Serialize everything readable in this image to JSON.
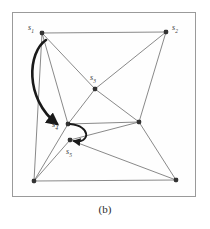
{
  "figure": {
    "caption": "(b)",
    "frame": {
      "border_color": "#9a9a9a",
      "background": "#fefefe"
    }
  },
  "diagram": {
    "type": "graph",
    "edge_color": "#6b6b6b",
    "node_color": "#333333",
    "arrow_color": "#1a1a1a",
    "nodes": [
      {
        "id": "s1",
        "label": "s",
        "sub": "1",
        "x": 42,
        "y": 33,
        "label_x": 28,
        "label_y": 24
      },
      {
        "id": "s2",
        "label": "s",
        "sub": "2",
        "x": 166,
        "y": 32,
        "label_x": 172,
        "label_y": 24
      },
      {
        "id": "s3",
        "label": "s",
        "sub": "3",
        "x": 95,
        "y": 89,
        "label_x": 90,
        "label_y": 74
      },
      {
        "id": "s4",
        "label": "s",
        "sub": "4",
        "x": 68,
        "y": 124,
        "label_x": 52,
        "label_y": 121
      },
      {
        "id": "s5",
        "label": "s",
        "sub": "5",
        "x": 70,
        "y": 140,
        "label_x": 66,
        "label_y": 148
      },
      {
        "id": "r1",
        "label": "",
        "sub": "",
        "x": 139,
        "y": 122,
        "label_x": 0,
        "label_y": 0
      },
      {
        "id": "b1",
        "label": "",
        "sub": "",
        "x": 34,
        "y": 181,
        "label_x": 0,
        "label_y": 0
      },
      {
        "id": "b2",
        "label": "",
        "sub": "",
        "x": 176,
        "y": 180,
        "label_x": 0,
        "label_y": 0
      }
    ],
    "edges": [
      {
        "from": "s1",
        "to": "s2"
      },
      {
        "from": "s1",
        "to": "s3"
      },
      {
        "from": "s1",
        "to": "s4"
      },
      {
        "from": "s1",
        "to": "b1"
      },
      {
        "from": "s2",
        "to": "s3"
      },
      {
        "from": "s2",
        "to": "r1"
      },
      {
        "from": "s3",
        "to": "r1"
      },
      {
        "from": "s3",
        "to": "s4"
      },
      {
        "from": "s4",
        "to": "r1"
      },
      {
        "from": "s4",
        "to": "b1"
      },
      {
        "from": "s5",
        "to": "r1"
      },
      {
        "from": "s5",
        "to": "b1"
      },
      {
        "from": "s5",
        "to": "b2"
      },
      {
        "from": "r1",
        "to": "b2"
      },
      {
        "from": "b1",
        "to": "b2"
      }
    ],
    "arrows": [
      {
        "name": "large-move-arrow",
        "path": "M 46 40 C 28 52, 24 98, 57 124"
      },
      {
        "name": "small-swap-arrow",
        "path": "M 70 124 C 92 126, 90 144, 74 141"
      }
    ]
  }
}
